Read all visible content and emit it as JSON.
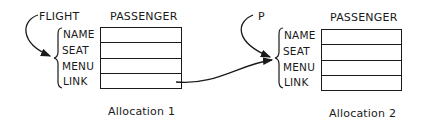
{
  "allocations": [
    {
      "pointer": "FLIGHT",
      "record": "PASSENGER",
      "fields": [
        "NAME",
        "SEAT",
        "MENU",
        "LINK"
      ],
      "caption": "Allocation 1"
    },
    {
      "pointer": "P",
      "record": "PASSENGER",
      "fields": [
        "NAME",
        "SEAT",
        "MENU",
        "LINK"
      ],
      "caption": "Allocation 2"
    }
  ]
}
